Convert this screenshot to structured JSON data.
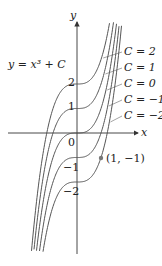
{
  "figure": {
    "equation": "y = x³ + C",
    "axis_x_label": "x",
    "axis_y_label": "y",
    "y_ticks": [
      "2",
      "1",
      "0",
      "−1",
      "−2"
    ],
    "curves": [
      {
        "label": "C = 2",
        "C": 2
      },
      {
        "label": "C = 1",
        "C": 1
      },
      {
        "label": "C = 0",
        "C": 0
      },
      {
        "label": "C = −1",
        "C": -1
      },
      {
        "label": "C = −2",
        "C": -2
      }
    ],
    "point_label": "(1, −1)",
    "colors": {
      "curve": "#555555",
      "axis": "#333333",
      "point": "#777777"
    }
  }
}
